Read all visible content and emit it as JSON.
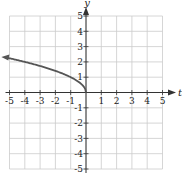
{
  "chart_data": {
    "type": "line",
    "title": "",
    "xlabel": "t",
    "ylabel": "y",
    "xlim": [
      -5,
      5
    ],
    "ylim": [
      -5,
      5
    ],
    "grid": true,
    "x_ticks": [
      -5,
      -4,
      -3,
      -2,
      -1,
      1,
      2,
      3,
      4,
      5
    ],
    "y_ticks": [
      -5,
      -4,
      -3,
      -2,
      -1,
      1,
      2,
      3,
      4,
      5
    ],
    "x_tick_labels": [
      "-5",
      "-4",
      "-3",
      "-2",
      "-1",
      "1",
      "2",
      "3",
      "4",
      "5"
    ],
    "y_tick_labels": [
      "-5",
      "-4",
      "-3",
      "-2",
      "-1",
      "1",
      "2",
      "3",
      "4",
      "5"
    ],
    "series": [
      {
        "name": "y = sqrt(-t)",
        "description": "curve starting at origin, extending left with arrow",
        "x": [
          0,
          -0.25,
          -0.5,
          -1,
          -2,
          -3,
          -4,
          -5,
          -5.4
        ],
        "y": [
          0,
          0.5,
          0.71,
          1,
          1.41,
          1.73,
          2,
          2.24,
          2.32
        ],
        "color": "#555555",
        "arrow_end": "left"
      }
    ]
  },
  "colors": {
    "grid": "#cccccc",
    "axis": "#333333",
    "curve": "#555555"
  }
}
